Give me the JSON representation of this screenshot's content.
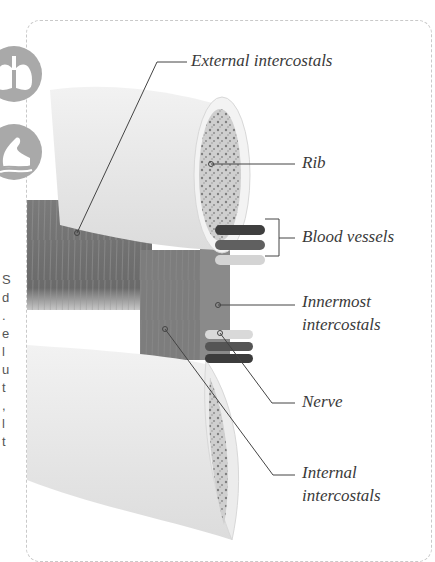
{
  "page": {
    "edge_text_fragments": [
      "S",
      "d",
      ".",
      "e",
      "l",
      "u",
      "t",
      ",",
      "l",
      "t"
    ]
  },
  "icons": [
    {
      "name": "lungs-icon",
      "color": "#a9a9a9"
    },
    {
      "name": "flexed-arm-muscle-icon",
      "color": "#a9a9a9"
    }
  ],
  "labels": {
    "external_intercostals": "External intercostals",
    "rib": "Rib",
    "blood_vessels": "Blood vessels",
    "innermost_line1": "Innermost",
    "innermost_line2": "intercostals",
    "nerve": "Nerve",
    "internal_line1": "Internal",
    "internal_line2": "intercostals"
  },
  "colors": {
    "bone": "#ececec",
    "marrow": "#9a9a9a",
    "muscle_dark": "#6e6e6e",
    "muscle_mid": "#8a8a8a",
    "leader_line": "#444444",
    "frame_border": "#c9c9c9"
  }
}
